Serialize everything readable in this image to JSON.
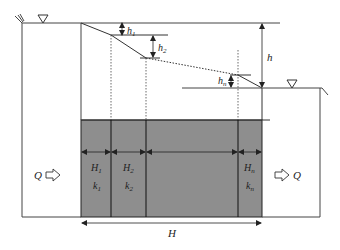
{
  "diagram": {
    "type": "layered-seepage-cross-section",
    "colors": {
      "line": "#333333",
      "soil_fill": "#8e8e8e",
      "background": "#ffffff"
    },
    "labels": {
      "flow_in": "Q",
      "flow_out": "Q",
      "total_head": "h",
      "total_length": "H",
      "head_loss_1": {
        "main": "h",
        "sub": "1"
      },
      "head_loss_2": {
        "main": "h",
        "sub": "2"
      },
      "head_loss_n": {
        "main": "h",
        "sub": "n"
      }
    },
    "layers": [
      {
        "length": {
          "main": "H",
          "sub": "1"
        },
        "permeability": {
          "main": "k",
          "sub": "1"
        }
      },
      {
        "length": {
          "main": "H",
          "sub": "2"
        },
        "permeability": {
          "main": "k",
          "sub": "2"
        }
      },
      {
        "length": {
          "main": "",
          "sub": ""
        },
        "permeability": {
          "main": "",
          "sub": ""
        }
      },
      {
        "length": {
          "main": "H",
          "sub": "n"
        },
        "permeability": {
          "main": "k",
          "sub": "n"
        }
      }
    ],
    "icons": {
      "water_level_upstream": "inverted-triangle",
      "water_level_downstream": "inverted-triangle",
      "flow_arrow_in": "hollow-right-arrow",
      "flow_arrow_out": "hollow-right-arrow"
    }
  }
}
